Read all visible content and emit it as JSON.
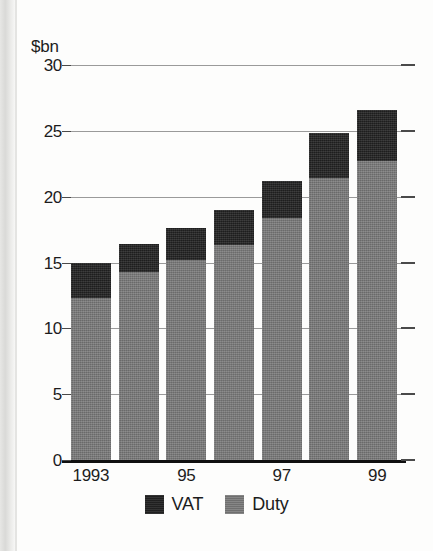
{
  "chart_data": {
    "type": "bar",
    "title": "",
    "subtitle": "",
    "xlabel": "",
    "ylabel": "$bn",
    "unit_label": "$bn",
    "stacked": true,
    "grid": true,
    "legend_position": "bottom-center",
    "categories": [
      "1993",
      "1994",
      "1995",
      "1996",
      "1997",
      "1998",
      "1999"
    ],
    "xtick_labels": [
      "1993",
      "95",
      "97",
      "99"
    ],
    "xtick_category_index": [
      0,
      2,
      4,
      6
    ],
    "ylim": [
      0,
      30
    ],
    "ytick_labels": [
      "0",
      "5",
      "10",
      "15",
      "20",
      "25",
      "30"
    ],
    "ytick_values": [
      0,
      5,
      10,
      15,
      20,
      25,
      30
    ],
    "series": [
      {
        "name": "Duty",
        "color": "#757575",
        "values": [
          12.3,
          14.3,
          15.2,
          16.3,
          18.4,
          21.4,
          22.7
        ]
      },
      {
        "name": "VAT",
        "color": "#232323",
        "values": [
          2.7,
          2.1,
          2.4,
          2.7,
          2.8,
          3.4,
          3.9
        ]
      }
    ],
    "totals": [
      15.0,
      16.4,
      17.6,
      19.0,
      21.2,
      24.8,
      26.6
    ],
    "legend": [
      {
        "label": "VAT",
        "color": "#232323",
        "swatch": "vat-swatch"
      },
      {
        "label": "Duty",
        "color": "#757575",
        "swatch": "duty-swatch"
      }
    ]
  },
  "colors": {
    "duty": "#757575",
    "vat": "#232323",
    "gridline": "#9a9a9a",
    "axis": "#101010",
    "text": "#1c1c1c",
    "background": "#fdfdfc"
  }
}
